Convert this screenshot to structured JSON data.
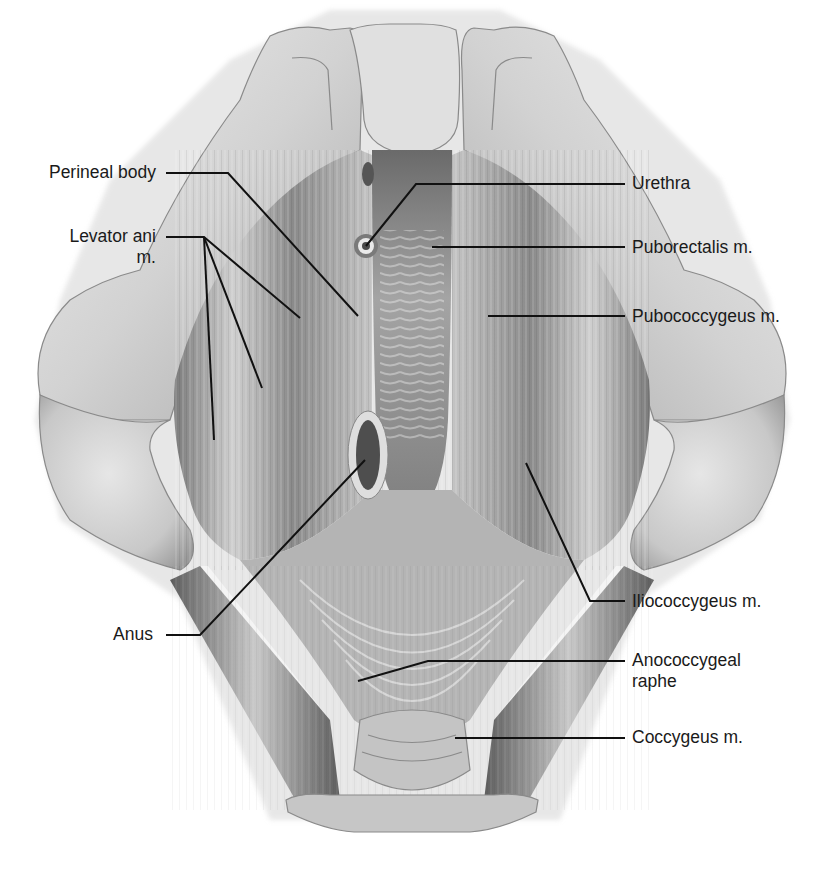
{
  "figure": {
    "colors": {
      "background": "#ffffff",
      "label_text": "#1a1a1a",
      "leader_line": "#111111",
      "bone_light": "#e2e2e2",
      "bone_mid": "#bdbdbd",
      "muscle_light": "#cfcfcf",
      "muscle_dark": "#6e6e6e",
      "opening_dark": "#4a4a4a"
    }
  },
  "labels": {
    "left": [
      {
        "id": "perineal-body",
        "text": "Perineal body",
        "x": 157,
        "y": 173
      },
      {
        "id": "levator-ani",
        "text": "Levator ani",
        "line2": "m.",
        "x": 157,
        "y": 237
      },
      {
        "id": "anus",
        "text": "Anus",
        "x": 153,
        "y": 635
      }
    ],
    "right": [
      {
        "id": "urethra",
        "text": "Urethra",
        "x": 632,
        "y": 184
      },
      {
        "id": "puborectalis",
        "text": "Puborectalis m.",
        "x": 632,
        "y": 248
      },
      {
        "id": "pubococcygeus",
        "text": "Pubococcygeus m.",
        "x": 632,
        "y": 317
      },
      {
        "id": "iliococcygeus",
        "text": "Iliococcygeus m.",
        "x": 632,
        "y": 602
      },
      {
        "id": "anococcygeal-raphe",
        "text": "Anococcygeal",
        "line2": "raphe",
        "x": 632,
        "y": 661
      },
      {
        "id": "coccygeus",
        "text": "Coccygeus m.",
        "x": 632,
        "y": 738
      }
    ]
  },
  "leaders": [
    {
      "for": "perineal-body",
      "points": "166,173 228,173 358,316"
    },
    {
      "for": "levator-ani-1",
      "points": "166,237 204,237 300,318"
    },
    {
      "for": "levator-ani-2",
      "points": "204,237 262,388"
    },
    {
      "for": "levator-ani-3",
      "points": "204,237 214,440"
    },
    {
      "for": "urethra",
      "points": "625,184 416,184 366,246"
    },
    {
      "for": "puborectalis",
      "points": "625,247 432,247"
    },
    {
      "for": "pubococcygeus",
      "points": "625,316 488,316"
    },
    {
      "for": "iliococcygeus",
      "points": "625,601 590,601 526,463"
    },
    {
      "for": "anococcygeal-raphe",
      "points": "625,661 428,661 358,681"
    },
    {
      "for": "anus",
      "points": "166,635 200,635 365,460"
    },
    {
      "for": "coccygeus",
      "points": "625,738 455,738"
    }
  ]
}
